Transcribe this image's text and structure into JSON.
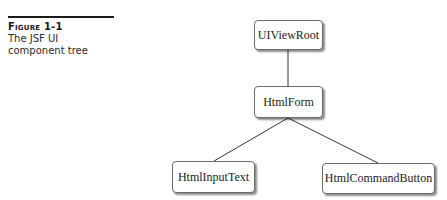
{
  "caption": {
    "label": "Figure 1-1",
    "text": "The JSF UI component tree"
  },
  "diagram": {
    "type": "tree",
    "nodes": [
      {
        "id": "root",
        "label": "UIViewRoot"
      },
      {
        "id": "form",
        "label": "HtmlForm"
      },
      {
        "id": "input",
        "label": "HtmlInputText"
      },
      {
        "id": "button",
        "label": "HtmlCommandButton"
      }
    ],
    "edges": [
      {
        "from": "root",
        "to": "form"
      },
      {
        "from": "form",
        "to": "input"
      },
      {
        "from": "form",
        "to": "button"
      }
    ]
  }
}
